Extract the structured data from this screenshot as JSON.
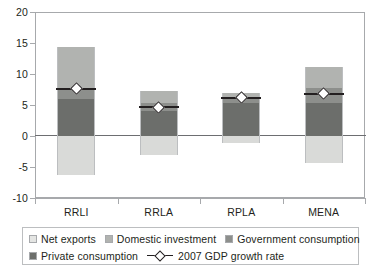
{
  "chart_data": {
    "type": "bar",
    "title": "",
    "subtitle": "",
    "xlabel": "",
    "ylabel": "",
    "stacked": true,
    "grid": false,
    "legend_position": "bottom",
    "ylim": [
      -10,
      20
    ],
    "yticks": [
      20,
      15,
      10,
      5,
      0,
      -5,
      -10
    ],
    "ytick_labels": [
      "20",
      "15",
      "10",
      "5",
      "0",
      "-5",
      "-10"
    ],
    "categories": [
      "RRLI",
      "RRLA",
      "RPLA",
      "MENA"
    ],
    "series": [
      {
        "name": "Private consumption",
        "key": "private-consumption",
        "color": "#6c6e6b",
        "values": [
          6.0,
          4.0,
          5.3,
          5.4
        ]
      },
      {
        "name": "Government consumption",
        "key": "government-consumption",
        "color": "#8d8f8c",
        "values": [
          1.8,
          1.3,
          0.6,
          2.3
        ]
      },
      {
        "name": "Domestic investment",
        "key": "domestic-investment",
        "color": "#b1b3b0",
        "values": [
          6.5,
          1.9,
          1.0,
          3.4
        ]
      },
      {
        "name": "Net exports",
        "key": "net-exports",
        "color": "#d9dad8",
        "values": [
          -6.3,
          -3.1,
          -1.2,
          -4.3
        ]
      }
    ],
    "overlay": {
      "name": "2007 GDP growth rate",
      "marker": "diamond",
      "marker_face_color": "#ffffff",
      "marker_edge_color": "#231f20",
      "values": [
        7.6,
        4.6,
        6.2,
        6.8
      ]
    }
  },
  "axes": {
    "y_labels": [
      "20",
      "15",
      "10",
      "5",
      "0",
      "-5",
      "-10"
    ],
    "x_labels": [
      "RRLI",
      "RRLA",
      "RPLA",
      "MENA"
    ]
  },
  "legend": {
    "row1": [
      {
        "label": "Net exports",
        "key": "net-exports"
      },
      {
        "label": "Domestic investment",
        "key": "domestic-investment"
      },
      {
        "label": "Government consumption",
        "key": "government-consumption"
      }
    ],
    "row2": [
      {
        "label": "Private consumption",
        "key": "private-consumption"
      }
    ],
    "overlay_label": "2007 GDP growth rate"
  }
}
